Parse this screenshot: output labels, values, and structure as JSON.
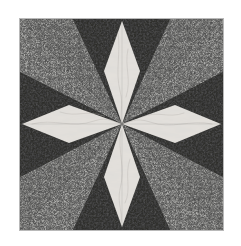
{
  "page": {
    "background_color": "#ffffff",
    "width": 241,
    "height": 246
  },
  "block": {
    "title": "Mariner's Compass Quilt Block",
    "frame": {
      "x": 19,
      "y": 18,
      "width": 205,
      "height": 213,
      "border_color": "#b9b9b9",
      "border_width": 1
    },
    "center": {
      "x": 102,
      "y": 105
    },
    "fabrics": [
      {
        "name": "background-print",
        "label": "Dark mottled black print",
        "color": "#2e2e2c",
        "speck_color": "#0a0a0a"
      },
      {
        "name": "wedge-solid",
        "label": "Medium gray solid",
        "color": "#a9a9a6",
        "shade_color": "#9a9a97"
      },
      {
        "name": "star-point-marble",
        "label": "Cream marbled",
        "color": "#e4e1dc",
        "vein_color": "#b6b2ad"
      }
    ],
    "geometry": {
      "compass_points": 8,
      "cardinal_points": 4,
      "ordinal_points": 4,
      "gray_wedges": 8
    }
  },
  "chart_data": {
    "type": "pie",
    "categories": [
      "North point (cream)",
      "East point (cream)",
      "South point (cream)",
      "West point (cream)",
      "NE wedge pair (gray)",
      "SE wedge pair (gray)",
      "SW wedge pair (gray)",
      "NW wedge pair (gray)",
      "Background (dark print)"
    ],
    "values": [
      6,
      6,
      6,
      6,
      9,
      9,
      9,
      9,
      40
    ],
    "xlabel": "",
    "ylabel": "",
    "legend_position": "none",
    "grid": false
  }
}
